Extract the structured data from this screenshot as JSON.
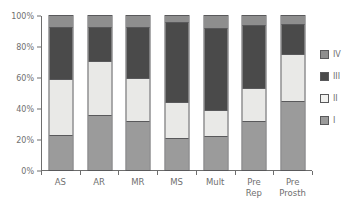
{
  "chart_data": {
    "type": "bar",
    "subtype": "stacked-percentage",
    "title": "",
    "xlabel": "",
    "ylabel": "",
    "ylim": [
      0,
      100
    ],
    "yticks": [
      0,
      20,
      40,
      60,
      80,
      100
    ],
    "ytick_labels": [
      "0%",
      "20%",
      "40%",
      "60%",
      "80%",
      "100%"
    ],
    "grid": false,
    "legend_position": "right",
    "categories": [
      "AS",
      "AR",
      "MR",
      "MS",
      "Mult",
      "Pre Rep",
      "Pre Prosth"
    ],
    "series": [
      {
        "name": "I",
        "color": "#9b9b9b",
        "values": [
          23,
          36,
          32,
          21,
          22,
          32,
          45
        ]
      },
      {
        "name": "II",
        "color": "#e9e9e7",
        "values": [
          36,
          35,
          28,
          23,
          17,
          21,
          30
        ]
      },
      {
        "name": "III",
        "color": "#4a4a4a",
        "values": [
          34,
          22,
          33,
          52,
          53,
          41,
          20
        ]
      },
      {
        "name": "IV",
        "color": "#8e8e8e",
        "values": [
          7,
          7,
          7,
          4,
          8,
          6,
          5
        ]
      }
    ],
    "legend_entries": [
      {
        "label": "IV",
        "color": "#8e8e8e"
      },
      {
        "label": "III",
        "color": "#4a4a4a"
      },
      {
        "label": "II",
        "color": "#f2f2f0"
      },
      {
        "label": "I",
        "color": "#9b9b9b"
      }
    ],
    "axis_color": "#6e6e6e",
    "bar_outline_color": "#59595b",
    "text_color": "#6f6f6f"
  }
}
